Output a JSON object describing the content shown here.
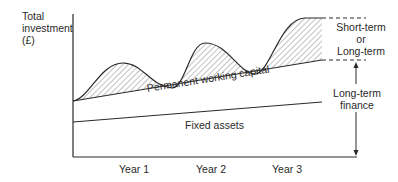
{
  "diagram": {
    "y_axis_label": [
      "Total",
      "investment",
      "(£)"
    ],
    "x_axis_ticks": [
      "Year 1",
      "Year 2",
      "Year 3"
    ],
    "regions": {
      "fluctuating": "fluctuating working capital (hatched)",
      "permanent_wc": "Permanent working capital",
      "fixed_assets": "Fixed assets"
    },
    "finance_labels": {
      "short_or_long": [
        "Short-term",
        "or",
        "Long-term"
      ],
      "long_term": [
        "Long-term",
        "finance"
      ]
    },
    "colors": {
      "line": "#2a2a2a",
      "hatch": "#555555",
      "background": "#ffffff"
    }
  }
}
